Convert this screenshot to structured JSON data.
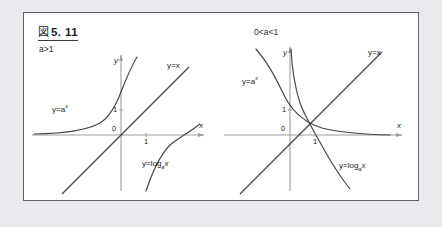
{
  "figure": {
    "label_kanji": "図",
    "number": "5. 11"
  },
  "panels": [
    {
      "id": "panel-a-gt-1",
      "condition": "a>1",
      "axes": {
        "x_name": "x",
        "y_name": "y",
        "origin_label": "0",
        "y_tick_label": "1",
        "x_tick_label": "1"
      },
      "curves": [
        {
          "name": "exponential",
          "label_head": "y=a",
          "label_sup": "x",
          "label_sub": ""
        },
        {
          "name": "identity-line",
          "label_head": "y=x",
          "label_sup": "",
          "label_sub": ""
        },
        {
          "name": "logarithm",
          "label_head": "y=log",
          "label_sub": "a",
          "label_tail": "x"
        }
      ]
    },
    {
      "id": "panel-a-between-0-1",
      "condition": "0<a<1",
      "axes": {
        "x_name": "x",
        "y_name": "y",
        "origin_label": "0",
        "y_tick_label": "1",
        "x_tick_label": "1"
      },
      "curves": [
        {
          "name": "exponential",
          "label_head": "y=a",
          "label_sup": "x",
          "label_sub": ""
        },
        {
          "name": "identity-line",
          "label_head": "y=x",
          "label_sup": "",
          "label_sub": ""
        },
        {
          "name": "logarithm",
          "label_head": "y=log",
          "label_sub": "a",
          "label_tail": "x"
        }
      ]
    }
  ],
  "colors": {
    "page_background": "#e9eaee",
    "card_background": "#ffffff",
    "border": "#5f6168",
    "curve": "#3b3c40",
    "axis": "#8e9096",
    "text": "#1d1e20"
  }
}
